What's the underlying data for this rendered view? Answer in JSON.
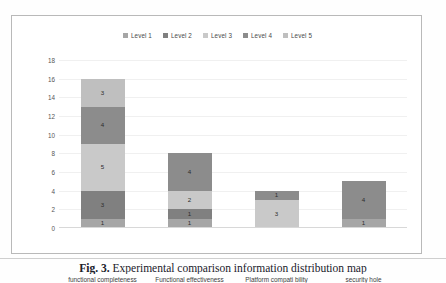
{
  "figure": {
    "caption_label": "Fig. 3.",
    "caption_text": "Experimental comparison information distribution map"
  },
  "chart_data": {
    "type": "bar",
    "subtype": "stacked-bar",
    "title": "",
    "xlabel": "",
    "ylabel": "",
    "ylim": [
      0,
      18
    ],
    "ytick_step": 2,
    "yticks": [
      "18",
      "16",
      "14",
      "12",
      "10",
      "8",
      "6",
      "4",
      "2",
      "0"
    ],
    "grid": true,
    "legend_position": "top-center",
    "categories": [
      "functional completeness",
      "Functional effectiveness",
      "Platform compati bility",
      "security hole"
    ],
    "series": [
      {
        "name": "Level 1",
        "color": "#a6a6a6",
        "values": [
          1,
          1,
          0,
          1
        ]
      },
      {
        "name": "Level 2",
        "color": "#808080",
        "values": [
          3,
          1,
          0,
          0
        ]
      },
      {
        "name": "Level 3",
        "color": "#c9c9c9",
        "values": [
          5,
          2,
          3,
          0
        ]
      },
      {
        "name": "Level 4",
        "color": "#8c8c8c",
        "values": [
          4,
          4,
          1,
          4
        ]
      },
      {
        "name": "Level 5",
        "color": "#bfbfbf",
        "values": [
          3,
          0,
          0,
          0
        ]
      }
    ],
    "totals": [
      16,
      8,
      4,
      5
    ],
    "data_labels": true
  }
}
